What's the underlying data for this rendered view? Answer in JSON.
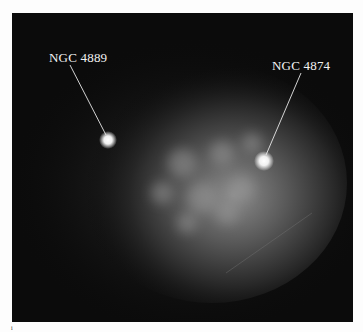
{
  "image": {
    "description": "Astronomical image of the Coma galaxy cluster core showing diffuse glow with two bright galaxies labeled",
    "background_color": "#0b0b0b",
    "glow_color": "#8a8a8a"
  },
  "annotations": [
    {
      "label": "NGC 4889",
      "label_x": 37,
      "label_y": 37,
      "target_x": 96,
      "target_y": 127
    },
    {
      "label": "NGC 4874",
      "label_x": 260,
      "label_y": 45,
      "target_x": 252,
      "target_y": 148
    }
  ],
  "footer_mark": "i"
}
